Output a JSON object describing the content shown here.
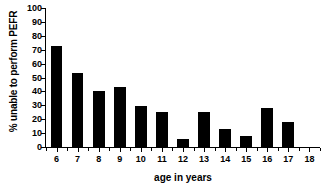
{
  "chart_data": {
    "type": "bar",
    "title": "",
    "xlabel": "age in years",
    "ylabel": "% unable to perform PEFR",
    "categories": [
      "6",
      "7",
      "8",
      "9",
      "10",
      "11",
      "12",
      "13",
      "14",
      "15",
      "16",
      "17",
      "18"
    ],
    "values": [
      73,
      53.5,
      40,
      43,
      29.5,
      25.5,
      5.5,
      25.5,
      13,
      8,
      28,
      18,
      0
    ],
    "ylim": [
      0,
      100
    ],
    "ytick_labels": [
      "0",
      "10",
      "20",
      "30",
      "40",
      "50",
      "60",
      "70",
      "80",
      "90",
      "100"
    ],
    "ytick_values": [
      0,
      10,
      20,
      30,
      40,
      50,
      60,
      70,
      80,
      90,
      100
    ],
    "grid": false,
    "legend": false,
    "bar_color": "#000000",
    "background_color": "#ffffff",
    "axis_color": "#000000"
  }
}
